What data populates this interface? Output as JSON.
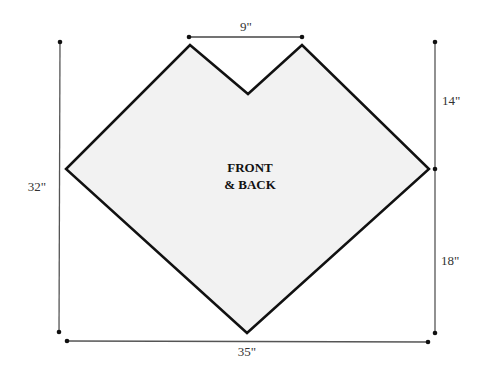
{
  "diagram": {
    "type": "sewing-pattern-piece",
    "piece_label": {
      "line1": "FRONT",
      "line2": "& BACK"
    },
    "colors": {
      "fill": "#f2f2f2",
      "outline": "#111111",
      "dimension_line": "#555555"
    },
    "dimensions": {
      "top_notch_width": "9\"",
      "total_height": "32\"",
      "upper_right_height": "14\"",
      "lower_right_height": "18\"",
      "total_width": "35\""
    }
  }
}
